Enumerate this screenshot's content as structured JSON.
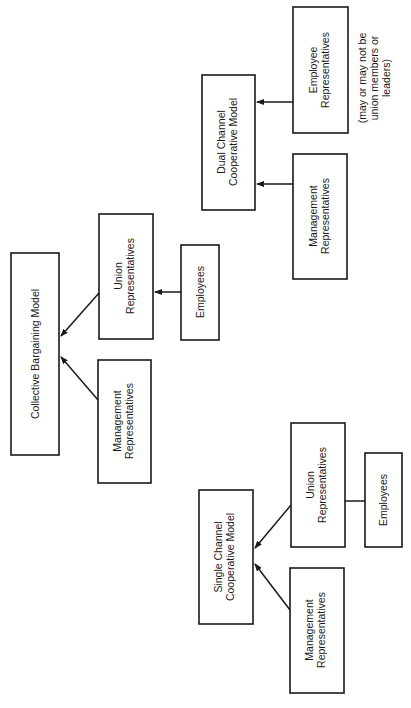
{
  "orientation": "rotated-90-ccw",
  "colors": {
    "ink": "#1a1a1a",
    "background": "#ffffff"
  },
  "models": {
    "collective_bargaining": {
      "title": "Collective Bargaining Model",
      "management": [
        "Management",
        "Representatives"
      ],
      "union": [
        "Union",
        "Representatives"
      ],
      "employees": "Employees"
    },
    "dual_channel": {
      "title": [
        "Dual Channel",
        "Cooperative Model"
      ],
      "management": [
        "Management",
        "Representatives"
      ],
      "employee_reps": [
        "Employee",
        "Representatives"
      ],
      "note": [
        "(may or may not be",
        "union members or",
        "leaders)"
      ]
    },
    "single_channel": {
      "title": [
        "Single Channel",
        "Cooperative Model"
      ],
      "management": [
        "Management",
        "Representatives"
      ],
      "union": [
        "Union",
        "Representatives"
      ],
      "employees": "Employees"
    }
  }
}
